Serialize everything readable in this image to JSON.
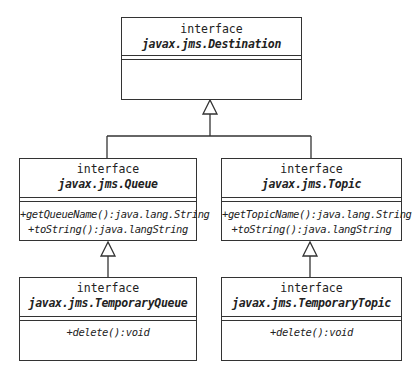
{
  "diagram": {
    "type": "UML class diagram",
    "stereotype_label": "interface",
    "classes": [
      {
        "id": "destination",
        "stereotype": "interface",
        "name": "javax.jms.Destination",
        "operations": []
      },
      {
        "id": "queue",
        "stereotype": "interface",
        "name": "javax.jms.Queue",
        "operations": [
          "+getQueueName():java.lang.String",
          "+toString():java.langString"
        ]
      },
      {
        "id": "topic",
        "stereotype": "interface",
        "name": "javax.jms.Topic",
        "operations": [
          "+getTopicName():java.lang.String",
          "+toString():java.langString"
        ]
      },
      {
        "id": "temporary_queue",
        "stereotype": "interface",
        "name": "javax.jms.TemporaryQueue",
        "operations": [
          "+delete():void"
        ]
      },
      {
        "id": "temporary_topic",
        "stereotype": "interface",
        "name": "javax.jms.TemporaryTopic",
        "operations": [
          "+delete():void"
        ]
      }
    ],
    "relationships": [
      {
        "type": "generalization",
        "from": "queue",
        "to": "destination"
      },
      {
        "type": "generalization",
        "from": "topic",
        "to": "destination"
      },
      {
        "type": "generalization",
        "from": "temporary_queue",
        "to": "queue"
      },
      {
        "type": "generalization",
        "from": "temporary_topic",
        "to": "topic"
      }
    ],
    "colors": {
      "line": "#333333",
      "background": "#ffffff",
      "text": "#222222"
    }
  }
}
